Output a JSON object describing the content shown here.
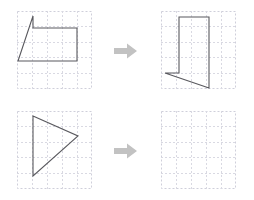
{
  "page": {
    "background": "#ffffff",
    "width": 254,
    "height": 200
  },
  "style": {
    "grid_line_color": "#d9d9e2",
    "grid_border_color": "#cfcfda",
    "shape_stroke_color": "#59595e",
    "shape_fill": "none",
    "arrow_color": "#c2c2c2",
    "grid_cols": 5,
    "grid_rows": 5,
    "cell_size": 15,
    "shape_stroke_width": 1.1
  },
  "rows": [
    {
      "id": "row-top",
      "name": "top-transformation-row",
      "arrow": {
        "icon": "arrow-right-icon",
        "label": "transforms to"
      },
      "source": {
        "panel_name": "top-left-grid-panel",
        "shape_name": "source-shape-quadrilateral",
        "shape_type": "polygon",
        "points": "16,5 16,17 60,17 60,50 1,50",
        "closed": true,
        "vertex_count": 5
      },
      "target": {
        "panel_name": "top-right-grid-panel",
        "shape_name": "target-shape-rotated-quadrilateral",
        "shape_type": "polygon",
        "points": "18,6 48,6 48,77 4,62 18,62",
        "closed": true,
        "vertex_count": 5
      }
    },
    {
      "id": "row-bottom",
      "name": "bottom-transformation-row",
      "arrow": {
        "icon": "arrow-right-icon",
        "label": "transforms to"
      },
      "source": {
        "panel_name": "bottom-left-grid-panel",
        "shape_name": "source-shape-triangle",
        "shape_type": "polygon",
        "points": "16,5 61,25 16,65",
        "closed": true,
        "vertex_count": 3
      },
      "target": {
        "panel_name": "bottom-right-grid-panel",
        "shape_name": "target-shape-empty",
        "shape_type": "none",
        "points": "",
        "closed": false,
        "vertex_count": 0
      }
    }
  ]
}
